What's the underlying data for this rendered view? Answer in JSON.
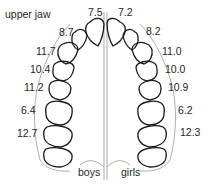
{
  "diagram": {
    "title": "upper jaw",
    "midline_color": "#b8b8b8",
    "tooth_stroke": "#1a1a1a",
    "arch_color": "#9a9a9a",
    "left_side": {
      "label": "boys",
      "values": [
        "7.5",
        "8.7",
        "11.7",
        "10.4",
        "11.2",
        "6.4",
        "12.7"
      ]
    },
    "right_side": {
      "label": "girls",
      "values": [
        "7.2",
        "8.2",
        "11.0",
        "10.0",
        "10.9",
        "6.2",
        "12.3"
      ]
    }
  }
}
